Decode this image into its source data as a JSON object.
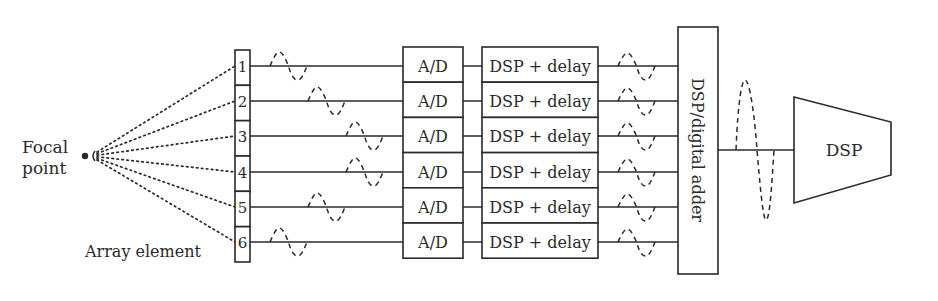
{
  "diagram": {
    "focal_label_line1": "Focal",
    "focal_label_line2": "point",
    "array_label": "Array element",
    "elements": [
      "1",
      "2",
      "3",
      "4",
      "5",
      "6"
    ],
    "ad_label": "A/D",
    "dsp_delay_label": "DSP + delay",
    "adder_label": "DSP/digital adder",
    "dsp_label": "DSP",
    "channel_count": 6,
    "wave_offsets": [
      0,
      1,
      2,
      2,
      1,
      0
    ],
    "colors": {
      "ink": "#2a2a2a",
      "background": "#ffffff"
    }
  }
}
